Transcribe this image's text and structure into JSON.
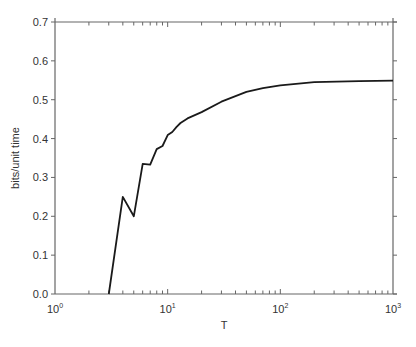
{
  "chart_data": {
    "type": "line",
    "title": "",
    "xlabel": "T",
    "ylabel": "bits/unit time",
    "xscale": "log",
    "xlim": [
      1,
      1000
    ],
    "ylim": [
      0.0,
      0.7
    ],
    "grid": false,
    "legend": null,
    "x_ticks": [
      {
        "value": 1,
        "base": "10",
        "exp": "0"
      },
      {
        "value": 10,
        "base": "10",
        "exp": "1"
      },
      {
        "value": 100,
        "base": "10",
        "exp": "2"
      },
      {
        "value": 1000,
        "base": "10",
        "exp": "3"
      }
    ],
    "y_ticks": [
      "0.0",
      "0.1",
      "0.2",
      "0.3",
      "0.4",
      "0.5",
      "0.6",
      "0.7"
    ],
    "series": [
      {
        "name": "rate",
        "color": "#1a1a1a",
        "x": [
          3,
          4,
          5,
          6,
          7,
          8,
          9,
          10,
          11,
          12,
          13,
          15,
          20,
          30,
          50,
          70,
          100,
          200,
          500,
          1000
        ],
        "y": [
          0.0,
          0.25,
          0.2,
          0.335,
          0.333,
          0.373,
          0.381,
          0.409,
          0.417,
          0.43,
          0.44,
          0.452,
          0.468,
          0.495,
          0.52,
          0.53,
          0.537,
          0.545,
          0.548,
          0.549
        ]
      }
    ]
  }
}
